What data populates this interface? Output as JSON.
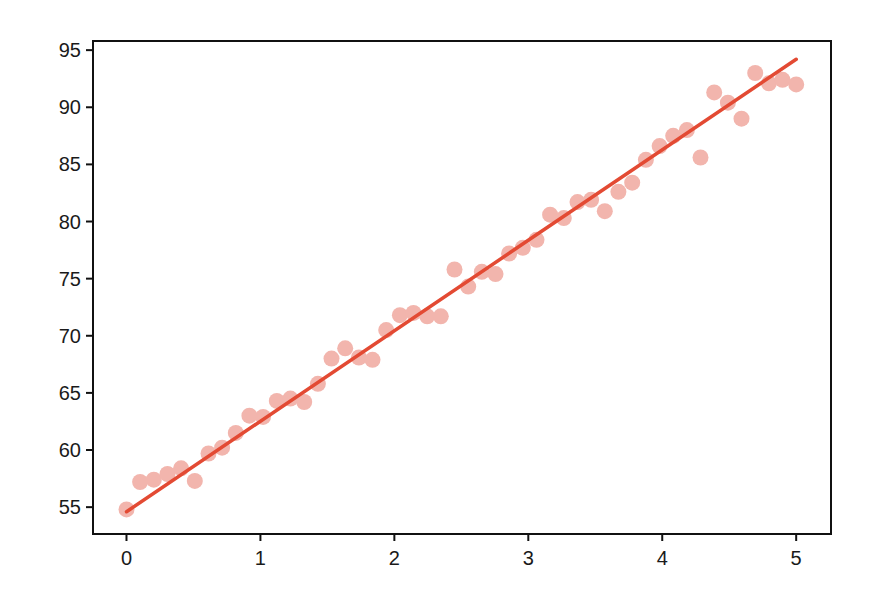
{
  "chart_data": {
    "type": "scatter",
    "title": "",
    "xlabel": "",
    "ylabel": "",
    "xlim": [
      -0.25,
      5.26
    ],
    "ylim": [
      52.65,
      95.8
    ],
    "grid": false,
    "legend": null,
    "x_ticks": [
      0,
      1,
      2,
      3,
      4,
      5
    ],
    "x_tick_labels": [
      "0",
      "1",
      "2",
      "3",
      "4",
      "5"
    ],
    "y_ticks": [
      55,
      60,
      65,
      70,
      75,
      80,
      85,
      90,
      95
    ],
    "y_tick_labels": [
      "55",
      "60",
      "65",
      "70",
      "75",
      "80",
      "85",
      "90",
      "95"
    ],
    "series": [
      {
        "name": "observed data",
        "kind": "scatter",
        "color": "#f2b5ad",
        "marker_radius": 8,
        "x": [
          0.0,
          0.102,
          0.204,
          0.306,
          0.408,
          0.51,
          0.612,
          0.714,
          0.816,
          0.918,
          1.02,
          1.122,
          1.224,
          1.327,
          1.429,
          1.531,
          1.633,
          1.735,
          1.837,
          1.939,
          2.041,
          2.143,
          2.245,
          2.347,
          2.449,
          2.551,
          2.653,
          2.755,
          2.857,
          2.959,
          3.061,
          3.163,
          3.265,
          3.367,
          3.469,
          3.571,
          3.673,
          3.776,
          3.878,
          3.98,
          4.082,
          4.184,
          4.286,
          4.388,
          4.49,
          4.592,
          4.694,
          4.796,
          4.898,
          5.0
        ],
        "y": [
          54.8,
          57.2,
          57.4,
          57.9,
          58.4,
          57.3,
          59.7,
          60.2,
          61.5,
          63.0,
          62.9,
          64.3,
          64.5,
          64.2,
          65.8,
          68.0,
          68.9,
          68.1,
          67.9,
          70.5,
          71.8,
          72.0,
          71.7,
          71.7,
          75.8,
          74.3,
          75.6,
          75.4,
          77.2,
          77.7,
          78.4,
          80.6,
          80.3,
          81.7,
          81.9,
          80.9,
          82.6,
          83.4,
          85.4,
          86.6,
          87.5,
          88.0,
          85.6,
          91.3,
          90.4,
          89.0,
          93.0,
          92.1,
          92.4,
          92.0
        ]
      },
      {
        "name": "fitted line",
        "kind": "line",
        "color": "#e34a33",
        "line_width": 3.5,
        "x": [
          0.0,
          5.0
        ],
        "y": [
          54.6,
          94.2
        ]
      }
    ]
  }
}
